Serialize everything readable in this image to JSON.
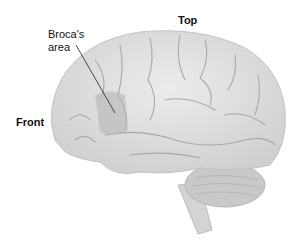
{
  "diagram": {
    "labels": {
      "top": "Top",
      "front": "Front",
      "broca_line1": "Broca's",
      "broca_line2": "area"
    },
    "colors": {
      "brain": "#dcdcdc",
      "sulci": "#a8a8a8",
      "broca_area": "#b5b5b5",
      "cerebellum": "#c8c8c8",
      "text": "#111111"
    }
  }
}
